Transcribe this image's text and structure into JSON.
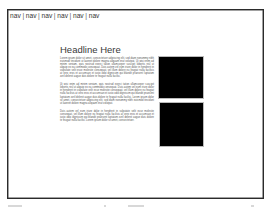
{
  "nav": {
    "items": [
      "nav",
      "nav",
      "nav",
      "nav",
      "nav",
      "nav"
    ],
    "separator": "|"
  },
  "main": {
    "headline": "Headline Here",
    "paragraphs": [
      "Lorem ipsum dolor sit amet, consectetuer adipiscing elit, sed diam nonummy nibh euismod tincidunt ut laoreet dolore magna aliquam erat volutpat. Ut wisi enim ad minim veniam, quis nostrud exerci tation ullamcorper suscipit lobortis nisl ut aliquip ex ea commodo consequat. Duis autem vel eum iriure dolor in hendrerit in vulputate velit esse molestie consequat, vel illum dolore eu feugiat nulla facilisis at vero eros et accumsan et iusto odio dignissim qui blandit praesent luptatum zzril delenit augue duis dolore te feugait nulla facilisi.",
      "Ut wisi enim ad minim veniam, quis nostrud exerci tation ullamcorper suscipit lobortis nisl ut aliquip ex ea commodo consequat. Duis autem vel eum iriure dolor in hendrerit in vulputate velit esse molestie consequat, vel illum dolore eu feugiat nulla facilisis at vero eros et accumsan et iusto odio dignissim qui blandit praesent luptatum zzril delenit augue duis dolore te feugait nulla facilisi. Lorem ipsum dolor sit amet, consectetuer adipiscing elit, sed diam nonummy nibh euismod tincidunt ut laoreet dolore magna aliquam erat volutpat.",
      "Duis autem vel eum iriure dolor in hendrerit in vulputate velit esse molestie consequat, vel illum dolore eu feugiat nulla facilisis at vero eros et accumsan et iusto odio dignissim qui blandit praesent luptatum zzril delenit augue duis dolore te feugait nulla facilisi. Lorem ipsum dolor sit amet, consectetuer."
    ]
  },
  "images": [
    {
      "label": "image-placeholder",
      "color": "#000000"
    },
    {
      "label": "image-placeholder",
      "color": "#000000"
    }
  ]
}
